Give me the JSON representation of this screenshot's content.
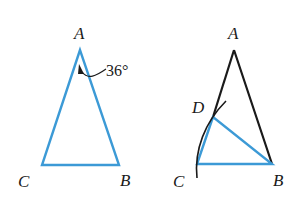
{
  "colors": {
    "blue": "#3c9ad6",
    "black": "#1a1a1a"
  },
  "figure_left": {
    "labels": {
      "A": "A",
      "B": "B",
      "C": "C"
    },
    "angle_label": "36°"
  },
  "figure_right": {
    "labels": {
      "A": "A",
      "B": "B",
      "C": "C",
      "D": "D"
    }
  }
}
